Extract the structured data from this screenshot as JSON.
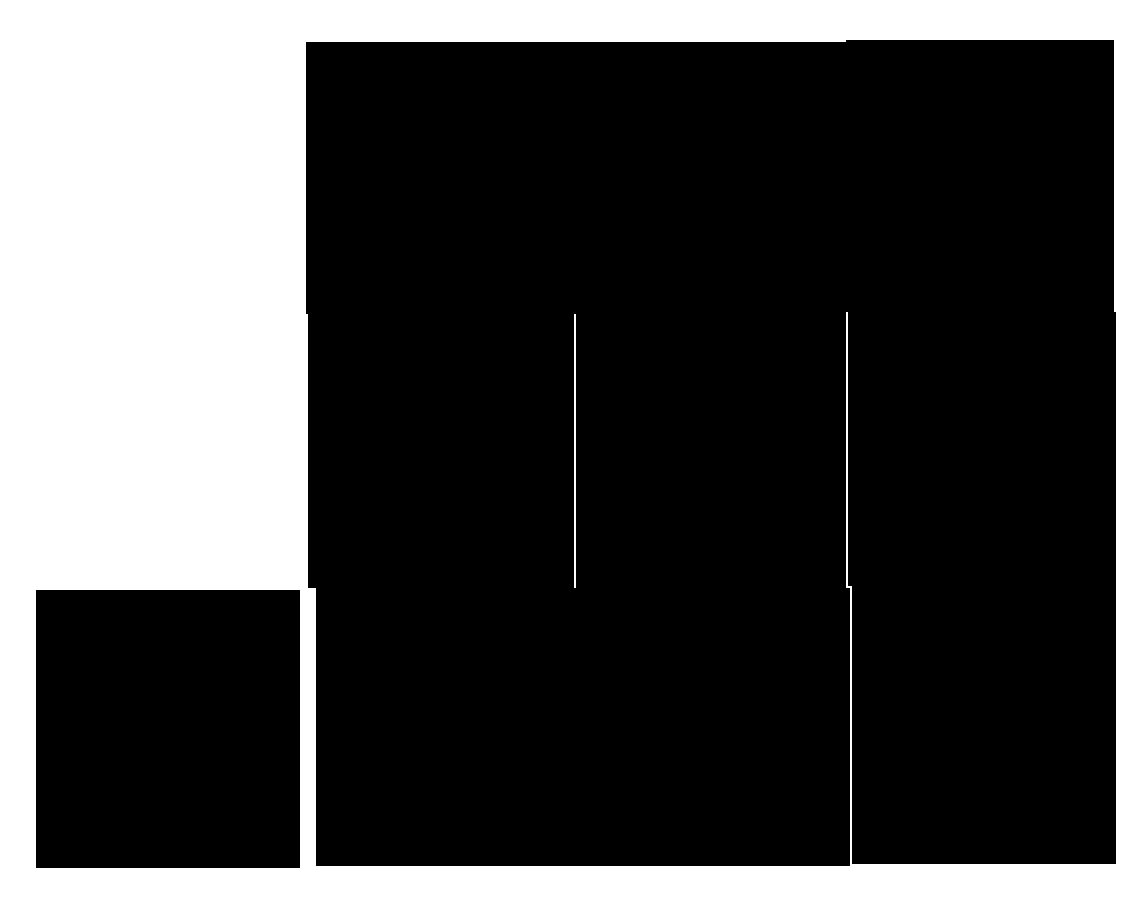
{
  "figure": {
    "stroke_color": "#2b2b2b",
    "background": "#ffffff",
    "single_tile": {
      "orientation": "0deg"
    },
    "grid": {
      "rows": 3,
      "cols": 3,
      "cells": [
        [
          "0deg",
          "180deg",
          "0deg"
        ],
        [
          "180deg",
          "0deg",
          "180deg"
        ],
        [
          "0deg",
          "180deg",
          "0deg"
        ]
      ]
    }
  }
}
